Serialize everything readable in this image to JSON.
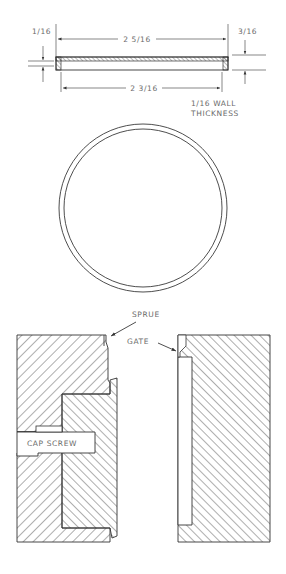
{
  "figure": {
    "part_section": {
      "dims": {
        "outer_diameter": "2 5/16",
        "inner_diameter": "2 3/16",
        "top_thickness": "1/16",
        "height": "3/16"
      },
      "note_line1": "1/16 WALL",
      "note_line2": "THICKNESS"
    },
    "part_plan": {
      "shape": "ring"
    },
    "mold": {
      "labels": {
        "sprue": "SPRUE",
        "gate": "GATE",
        "cap_screw": "CAP SCREW"
      }
    }
  },
  "colors": {
    "line": "#333333",
    "text": "#6a6a6a",
    "background": "#ffffff"
  }
}
